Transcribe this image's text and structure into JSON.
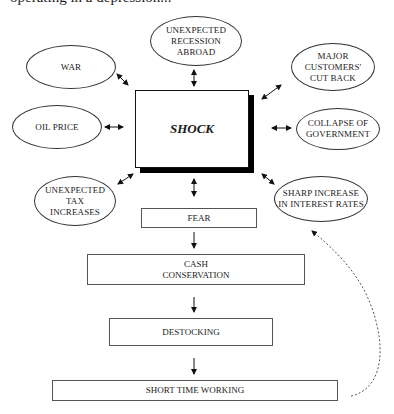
{
  "header": {
    "clipped_text": "operating in a depression..."
  },
  "center": {
    "label": "SHOCK"
  },
  "causes": [
    {
      "id": "war",
      "label": "WAR"
    },
    {
      "id": "recession",
      "label": "UNEXPECTED\nRECESSION\nABROAD"
    },
    {
      "id": "customers",
      "label": "MAJOR\nCUSTOMERS'\nCUT BACK"
    },
    {
      "id": "oil",
      "label": "OIL PRICE"
    },
    {
      "id": "government",
      "label": "COLLAPSE OF\nGOVERNMENT"
    },
    {
      "id": "tax",
      "label": "UNEXPECTED\nTAX\nINCREASES"
    },
    {
      "id": "interest",
      "label": "SHARP INCREASE\nIN INTEREST RATES"
    }
  ],
  "chain": [
    {
      "id": "fear",
      "label": "FEAR"
    },
    {
      "id": "cash",
      "label": "CASH\nCONSERVATION"
    },
    {
      "id": "destocking",
      "label": "DESTOCKING"
    },
    {
      "id": "short-time",
      "label": "SHORT TIME WORKING"
    }
  ],
  "feedback": {
    "description": "dashed feedback arrow from SHORT TIME WORKING back to FEAR"
  },
  "colors": {
    "line": "#333333",
    "shadow": "#000000",
    "dashed": "#555555"
  }
}
